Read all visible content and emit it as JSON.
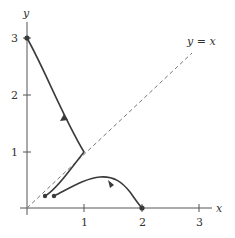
{
  "diagram": {
    "axes": {
      "x_label": "x",
      "y_label": "y",
      "x_ticks": [
        "1",
        "2",
        "3"
      ],
      "y_ticks": [
        "1",
        "2",
        "3"
      ]
    },
    "reference_line": {
      "label": "y = x",
      "style": "dashed"
    },
    "trajectories": [
      {
        "name": "trajectory-from-0-3",
        "start": [
          0,
          3
        ],
        "corner": [
          1,
          1
        ],
        "end": [
          0.3,
          0.2
        ],
        "arrow_direction": "up-left"
      },
      {
        "name": "trajectory-to-2-0",
        "start": [
          0.5,
          0.2
        ],
        "peak": [
          1.3,
          0.55
        ],
        "end": [
          2,
          0
        ],
        "arrow_direction": "down-right"
      }
    ],
    "colors": {
      "curve": "#3a3a3a",
      "axis": "#555555",
      "dashed_line": "#777777"
    }
  }
}
